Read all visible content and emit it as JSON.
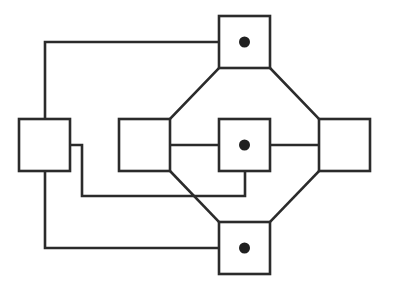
{
  "diagram": {
    "type": "block-graph",
    "colors": {
      "background": "#ffffff",
      "stroke": "#2b2b2b",
      "dot": "#202020"
    },
    "nodes": [
      {
        "id": "left",
        "x": 19,
        "y": 119,
        "w": 51,
        "h": 52,
        "marked": false
      },
      {
        "id": "mid-left",
        "x": 119,
        "y": 119,
        "w": 51,
        "h": 52,
        "marked": false
      },
      {
        "id": "center",
        "x": 219,
        "y": 119,
        "w": 51,
        "h": 52,
        "marked": true
      },
      {
        "id": "right",
        "x": 319,
        "y": 119,
        "w": 51,
        "h": 52,
        "marked": false
      },
      {
        "id": "top",
        "x": 219,
        "y": 16,
        "w": 51,
        "h": 52,
        "marked": true
      },
      {
        "id": "bottom",
        "x": 219,
        "y": 222,
        "w": 51,
        "h": 52,
        "marked": true
      }
    ],
    "edges": [
      {
        "id": "left-to-top",
        "points": [
          [
            45,
            119
          ],
          [
            45,
            42
          ],
          [
            219,
            42
          ]
        ]
      },
      {
        "id": "left-to-center",
        "points": [
          [
            70,
            145
          ],
          [
            82,
            145
          ],
          [
            82,
            196
          ],
          [
            245,
            196
          ],
          [
            245,
            171
          ]
        ]
      },
      {
        "id": "left-to-bottom",
        "points": [
          [
            45,
            171
          ],
          [
            45,
            248
          ],
          [
            219,
            248
          ]
        ]
      },
      {
        "id": "midleft-to-top",
        "points": [
          [
            170,
            119
          ],
          [
            219,
            68
          ]
        ]
      },
      {
        "id": "top-to-right",
        "points": [
          [
            270,
            68
          ],
          [
            319,
            119
          ]
        ]
      },
      {
        "id": "midleft-to-center",
        "points": [
          [
            170,
            145
          ],
          [
            219,
            145
          ]
        ]
      },
      {
        "id": "center-to-right",
        "points": [
          [
            270,
            145
          ],
          [
            319,
            145
          ]
        ]
      },
      {
        "id": "midleft-to-bottom",
        "points": [
          [
            170,
            171
          ],
          [
            219,
            222
          ]
        ]
      },
      {
        "id": "right-to-bottom",
        "points": [
          [
            319,
            171
          ],
          [
            270,
            222
          ]
        ]
      }
    ],
    "dot_radius": 5.5
  }
}
